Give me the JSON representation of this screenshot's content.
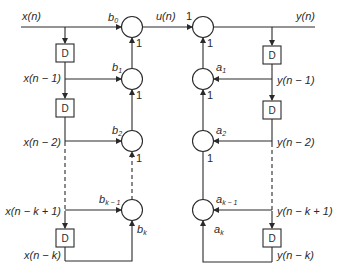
{
  "diagram": {
    "type": "signal-flow-graph",
    "title": "",
    "delay_label": "D",
    "gain_label": "1",
    "input": {
      "signal": "x(n)"
    },
    "intermediate": {
      "signal": "u(n)"
    },
    "output": {
      "signal": "y(n)"
    },
    "left_taps": [
      {
        "signal": "x(n)",
        "coef": "b",
        "sub": "0"
      },
      {
        "signal": "x(n − 1)",
        "coef": "b",
        "sub": "1"
      },
      {
        "signal": "x(n − 2)",
        "coef": "b",
        "sub": "2"
      },
      {
        "signal": "x(n − k + 1)",
        "coef": "b",
        "sub": "k − 1"
      },
      {
        "signal": "x(n − k)",
        "coef": "b",
        "sub": "k"
      }
    ],
    "right_taps": [
      {
        "signal": "y(n)",
        "coef": "",
        "sub": ""
      },
      {
        "signal": "y(n − 1)",
        "coef": "a",
        "sub": "1"
      },
      {
        "signal": "y(n − 2)",
        "coef": "a",
        "sub": "2"
      },
      {
        "signal": "y(n − k + 1)",
        "coef": "a",
        "sub": "k − 1"
      },
      {
        "signal": "y(n − k)",
        "coef": "a",
        "sub": "k"
      }
    ],
    "u_gain": "1"
  }
}
